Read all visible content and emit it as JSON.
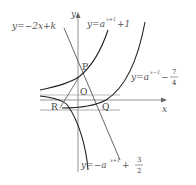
{
  "diagram": {
    "axes": {
      "x_label": "x",
      "y_label": "y",
      "origin_label": "O"
    },
    "points": {
      "P": "P",
      "Q": "Q",
      "R": "R"
    },
    "curves": [
      {
        "id": "line",
        "label_main": "y=−2x+k"
      },
      {
        "id": "exp1",
        "label_main": "y=a",
        "label_sup": "x+1",
        "label_tail": "+1"
      },
      {
        "id": "exp2",
        "label_main": "y=a",
        "label_sup": "x−1",
        "label_tail": "−",
        "frac_num": "7",
        "frac_den": "4"
      },
      {
        "id": "exp3",
        "label_main": "y=−a",
        "label_sup": "x+1",
        "label_tail": "+",
        "frac_num": "3",
        "frac_den": "2"
      }
    ],
    "colors": {
      "curve": "#333333",
      "axis": "#777777",
      "asymptote": "#999999",
      "text": "#555555"
    }
  }
}
